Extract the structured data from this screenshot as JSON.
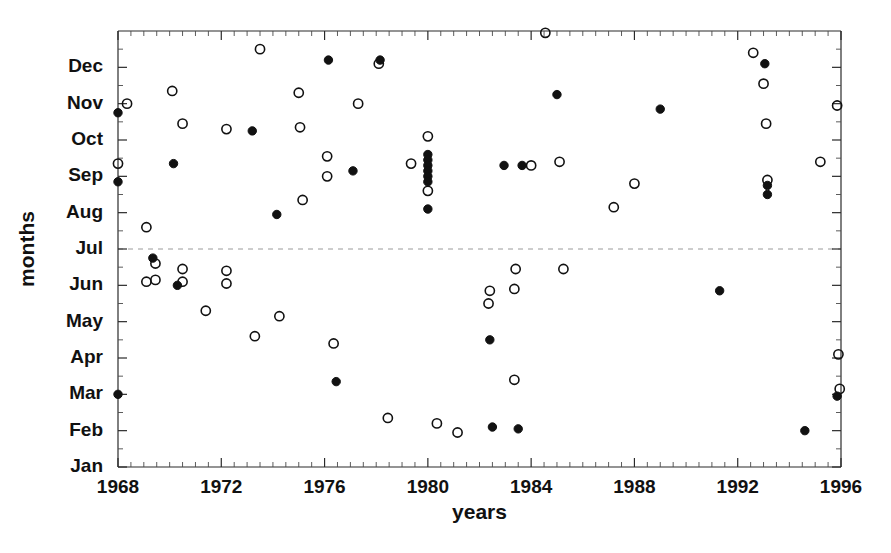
{
  "chart_data": {
    "type": "scatter",
    "title": "",
    "xlabel": "years",
    "ylabel": "months",
    "xlim": [
      1968,
      1996
    ],
    "ylim": [
      1,
      13
    ],
    "grid": false,
    "legend_position": "none",
    "x_ticks": [
      1968,
      1972,
      1976,
      1980,
      1984,
      1988,
      1992,
      1996
    ],
    "x_tick_labels": [
      "1968",
      "1972",
      "1976",
      "1980",
      "1984",
      "1988",
      "1992",
      "1996"
    ],
    "x_minor_tick_interval": 0.5,
    "y_ticks": [
      1,
      2,
      3,
      4,
      5,
      6,
      7,
      8,
      9,
      10,
      11,
      12
    ],
    "y_tick_labels": [
      "Jan",
      "Feb",
      "Mar",
      "Apr",
      "May",
      "Jun",
      "Jul",
      "Aug",
      "Sep",
      "Oct",
      "Nov",
      "Dec"
    ],
    "reference_line": {
      "y": 7,
      "label": "Jul",
      "style": "dashed"
    },
    "series": [
      {
        "name": "open",
        "marker": "open-circle",
        "color": "#111111",
        "points": [
          [
            1968.0,
            9.35
          ],
          [
            1968.35,
            11.0
          ],
          [
            1969.1,
            7.6
          ],
          [
            1969.1,
            6.1
          ],
          [
            1969.45,
            6.6
          ],
          [
            1969.45,
            6.15
          ],
          [
            1970.1,
            11.35
          ],
          [
            1970.5,
            10.45
          ],
          [
            1970.5,
            6.45
          ],
          [
            1970.5,
            6.1
          ],
          [
            1971.4,
            5.3
          ],
          [
            1972.2,
            10.3
          ],
          [
            1972.2,
            6.4
          ],
          [
            1972.2,
            6.05
          ],
          [
            1973.3,
            4.6
          ],
          [
            1973.5,
            12.5
          ],
          [
            1974.25,
            5.15
          ],
          [
            1975.0,
            11.3
          ],
          [
            1975.05,
            10.35
          ],
          [
            1975.15,
            8.35
          ],
          [
            1976.1,
            9.55
          ],
          [
            1976.1,
            9.0
          ],
          [
            1976.35,
            4.4
          ],
          [
            1977.3,
            11.0
          ],
          [
            1978.1,
            12.1
          ],
          [
            1978.45,
            2.35
          ],
          [
            1979.35,
            9.35
          ],
          [
            1980.0,
            10.1
          ],
          [
            1980.0,
            8.6
          ],
          [
            1980.35,
            2.2
          ],
          [
            1981.15,
            1.95
          ],
          [
            1982.35,
            5.5
          ],
          [
            1982.4,
            5.85
          ],
          [
            1983.35,
            5.9
          ],
          [
            1983.4,
            6.45
          ],
          [
            1983.35,
            3.4
          ],
          [
            1984.0,
            9.3
          ],
          [
            1984.55,
            12.95
          ],
          [
            1985.1,
            9.4
          ],
          [
            1985.25,
            6.45
          ],
          [
            1987.2,
            8.15
          ],
          [
            1988.0,
            8.8
          ],
          [
            1992.6,
            12.4
          ],
          [
            1993.0,
            11.55
          ],
          [
            1993.1,
            10.45
          ],
          [
            1993.15,
            8.9
          ],
          [
            1995.2,
            9.4
          ],
          [
            1995.85,
            10.95
          ],
          [
            1995.9,
            4.1
          ],
          [
            1995.95,
            3.15
          ]
        ]
      },
      {
        "name": "filled",
        "marker": "filled-circle",
        "color": "#111111",
        "points": [
          [
            1968.0,
            10.75
          ],
          [
            1968.0,
            8.85
          ],
          [
            1968.0,
            3.0
          ],
          [
            1969.35,
            6.75
          ],
          [
            1970.15,
            9.35
          ],
          [
            1970.3,
            6.0
          ],
          [
            1973.2,
            10.25
          ],
          [
            1974.15,
            7.95
          ],
          [
            1976.15,
            12.2
          ],
          [
            1976.45,
            3.35
          ],
          [
            1977.1,
            9.15
          ],
          [
            1978.15,
            12.2
          ],
          [
            1980.0,
            9.6
          ],
          [
            1980.0,
            9.45
          ],
          [
            1980.0,
            9.3
          ],
          [
            1980.0,
            9.15
          ],
          [
            1980.0,
            9.0
          ],
          [
            1980.0,
            8.85
          ],
          [
            1980.0,
            8.1
          ],
          [
            1982.4,
            4.5
          ],
          [
            1982.5,
            2.1
          ],
          [
            1982.95,
            9.3
          ],
          [
            1983.5,
            2.05
          ],
          [
            1983.65,
            9.3
          ],
          [
            1985.0,
            11.25
          ],
          [
            1989.0,
            10.85
          ],
          [
            1991.3,
            5.85
          ],
          [
            1993.05,
            12.1
          ],
          [
            1993.15,
            8.75
          ],
          [
            1993.15,
            8.5
          ],
          [
            1994.6,
            2.0
          ],
          [
            1995.85,
            2.95
          ]
        ]
      }
    ]
  },
  "axes": {
    "x_title": "years",
    "y_title": "months"
  }
}
